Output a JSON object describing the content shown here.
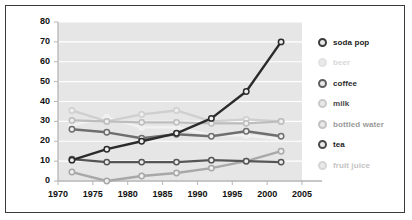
{
  "chart_data": {
    "type": "line",
    "title": "",
    "xlabel": "",
    "ylabel": "",
    "x": [
      1972,
      1977,
      1982,
      1987,
      1992,
      1997,
      2002
    ],
    "xlim": [
      1970,
      2005
    ],
    "ylim": [
      0,
      80
    ],
    "xticks": [
      1970,
      1975,
      1980,
      1985,
      1990,
      1995,
      2000,
      2005
    ],
    "yticks": [
      0,
      10,
      20,
      30,
      40,
      50,
      60,
      70,
      80
    ],
    "grid": "horizontal",
    "legend_position": "right",
    "series": [
      {
        "name": "soda pop",
        "color": "#2b2b2b",
        "values": [
          10.5,
          16,
          20,
          24,
          31.5,
          45,
          70
        ]
      },
      {
        "name": "beer",
        "color": "#f2f2f2",
        "values": [
          28,
          32,
          27,
          27,
          23,
          23,
          21
        ]
      },
      {
        "name": "coffee",
        "color": "#6e6e6e",
        "values": [
          26,
          24.5,
          21.5,
          23.5,
          22.5,
          25,
          22.5
        ]
      },
      {
        "name": "milk",
        "color": "#cfcfcf",
        "values": [
          35.5,
          30,
          33.5,
          35.5,
          30,
          31,
          30
        ]
      },
      {
        "name": "bottled water",
        "color": "#bdbdbd",
        "values": [
          30.5,
          30,
          29.5,
          29.5,
          29,
          29,
          30
        ]
      },
      {
        "name": "tea",
        "color": "#555555",
        "values": [
          11,
          9.5,
          9.5,
          9.5,
          10.5,
          10,
          9.5
        ]
      },
      {
        "name": "fruit juice",
        "color": "#a8a8a8",
        "values": [
          4.5,
          0,
          2.5,
          4,
          6.5,
          10,
          15
        ]
      }
    ]
  },
  "legend": {
    "items": [
      {
        "label": "soda pop",
        "marker": "#3a3a3a",
        "text": "#1c1c1c"
      },
      {
        "label": "beer",
        "marker": "#e2e2e2",
        "text": "#d8d8d8"
      },
      {
        "label": "coffee",
        "marker": "#5e5e5e",
        "text": "#2b2b2b"
      },
      {
        "label": "milk",
        "marker": "#c9c9c9",
        "text": "#4a4a4a"
      },
      {
        "label": "bottled water",
        "marker": "#c2c2c2",
        "text": "#9a9a9a"
      },
      {
        "label": "tea",
        "marker": "#4a4a4a",
        "text": "#222222"
      },
      {
        "label": "fruit juice",
        "marker": "#d5d5d5",
        "text": "#c4c4c4"
      }
    ]
  },
  "axes": {
    "y_labels": [
      "80",
      "70",
      "60",
      "50",
      "40",
      "30",
      "20",
      "10",
      "0"
    ],
    "x_labels": [
      "1970",
      "1975",
      "1980",
      "1985",
      "1990",
      "1995",
      "2000",
      "2005"
    ]
  },
  "colors": {
    "frame_border": "#3b3b3b",
    "plot_background": "#e6e6e6",
    "gridline": "#ffffff",
    "axis_line": "#b5b5b5",
    "page_background": "#ffffff"
  }
}
